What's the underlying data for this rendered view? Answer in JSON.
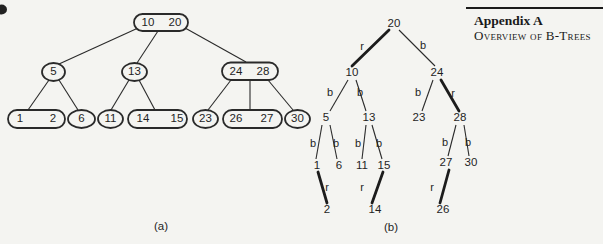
{
  "colors": {
    "background": "#f4f4f1",
    "ink": "#2a2a2a",
    "red_edge_drawn_as": "#1c1c1c"
  },
  "header": {
    "appendix_label": "Appendix A",
    "appendix_subtitle": "Overview of B-Trees"
  },
  "figure": {
    "caption_a": "(a)",
    "caption_b": "(b)",
    "btree": {
      "root": [
        "10",
        "20"
      ],
      "internal": {
        "n5": "5",
        "n13": "13",
        "n24": "24",
        "n28": "28"
      },
      "leaves": {
        "n1": "1",
        "n2": "2",
        "n6": "6",
        "n11": "11",
        "n14": "14",
        "n15": "15",
        "n23": "23",
        "n26": "26",
        "n27": "27",
        "n30": "30"
      }
    },
    "rbtree": {
      "nodes": {
        "n20": "20",
        "n10": "10",
        "n24": "24",
        "n5": "5",
        "n13": "13",
        "n23": "23",
        "n28": "28",
        "n1": "1",
        "n6": "6",
        "n11": "11",
        "n15": "15",
        "n27": "27",
        "n30": "30",
        "n2": "2",
        "n14": "14",
        "n26": "26"
      },
      "edge_labels": {
        "e20_10": "r",
        "e20_24": "b",
        "e10_5": "b",
        "e10_13": "b",
        "e24_23": "b",
        "e24_28": "r",
        "e5_1": "b",
        "e5_6": "b",
        "e13_11": "b",
        "e13_15": "b",
        "e28_27": "b",
        "e28_30": "b",
        "e1_2": "r",
        "e15_14": "r",
        "e27_26": "r"
      }
    }
  }
}
